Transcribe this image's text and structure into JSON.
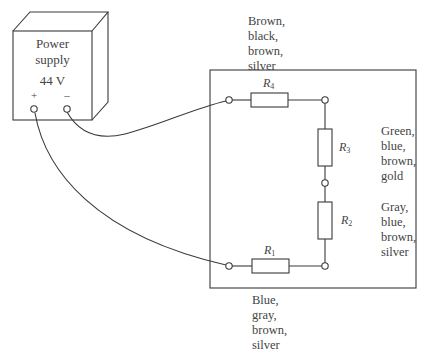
{
  "power_supply": {
    "label_line1": "Power",
    "label_line2": "supply",
    "voltage": "44 V",
    "plus_terminal": "+",
    "minus_terminal": "–"
  },
  "resistors": [
    {
      "name": "R",
      "index": "1",
      "bands": [
        "Blue,",
        "gray,",
        "brown,",
        "silver"
      ]
    },
    {
      "name": "R",
      "index": "2",
      "bands": [
        "Gray,",
        "blue,",
        "brown,",
        "silver"
      ]
    },
    {
      "name": "R",
      "index": "3",
      "bands": [
        "Green,",
        "blue,",
        "brown,",
        "gold"
      ]
    },
    {
      "name": "R",
      "index": "4",
      "bands": [
        "Brown,",
        "black,",
        "brown,",
        "silver"
      ]
    }
  ],
  "colors": {
    "line": "#3a3a3a",
    "background": "#ffffff"
  }
}
